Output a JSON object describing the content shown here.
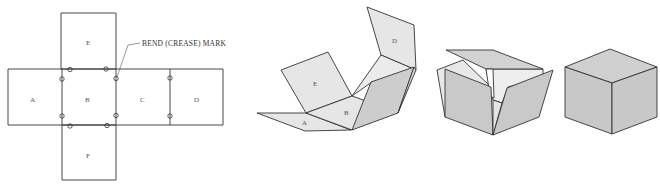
{
  "figure": {
    "colors": {
      "line": "#333333",
      "light_face": "#e6e6e6",
      "mid_face": "#d0d0d0",
      "dark_face": "#c4c4c4",
      "background": "#ffffff"
    }
  },
  "net": {
    "panels": [
      {
        "id": "A",
        "label": "A"
      },
      {
        "id": "B",
        "label": "B"
      },
      {
        "id": "C",
        "label": "C"
      },
      {
        "id": "D",
        "label": "D"
      },
      {
        "id": "E",
        "label": "E"
      },
      {
        "id": "F",
        "label": "F"
      }
    ],
    "callout": "BEND (CREASE) MARK",
    "crease_mark_count": 10
  },
  "stage2": {
    "labels": {
      "A": "A",
      "B": "B",
      "D": "D",
      "E": "E"
    }
  },
  "stage3": {},
  "stage4": {}
}
